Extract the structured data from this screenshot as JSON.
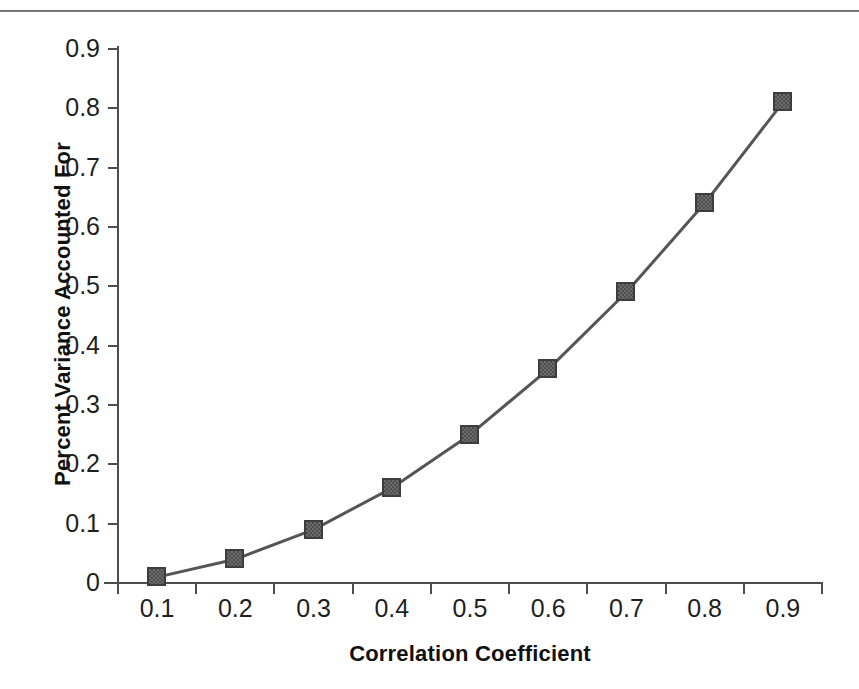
{
  "chart_data": {
    "type": "line",
    "title": "",
    "xlabel": "Correlation Coefficient",
    "ylabel": "Percent Variance Accounted For",
    "categories": [
      "0.1",
      "0.2",
      "0.3",
      "0.4",
      "0.5",
      "0.6",
      "0.7",
      "0.8",
      "0.9"
    ],
    "values": [
      0.01,
      0.04,
      0.09,
      0.16,
      0.25,
      0.36,
      0.49,
      0.64,
      0.81
    ],
    "x_tick_labels": [
      "0.1",
      "0.2",
      "0.3",
      "0.4",
      "0.5",
      "0.6",
      "0.7",
      "0.8",
      "0.9"
    ],
    "y_tick_labels": [
      "0.9",
      "0.8",
      "0.7",
      "0.6",
      "0.5",
      "0.4",
      "0.3",
      "0.2",
      "0.1",
      "0"
    ],
    "y_tick_values": [
      0.9,
      0.8,
      0.7,
      0.6,
      0.5,
      0.4,
      0.3,
      0.2,
      0.1,
      0
    ],
    "ylim": [
      0,
      0.9
    ],
    "grid": false,
    "legend": false,
    "legend_position": "none",
    "series": [
      {
        "name": "Percent Variance Accounted For",
        "marker": "square",
        "marker_color": "#6b6b6b",
        "line_color": "#555555",
        "values": [
          0.01,
          0.04,
          0.09,
          0.16,
          0.25,
          0.36,
          0.49,
          0.64,
          0.81
        ]
      }
    ]
  },
  "colors": {
    "line": "#555555",
    "marker_fill": "#6b6b6b",
    "marker_border": "#3d3d3d",
    "axis": "#4d4d4d",
    "text": "#1f1f1f",
    "title_text": "#111111",
    "background": "#ffffff"
  }
}
